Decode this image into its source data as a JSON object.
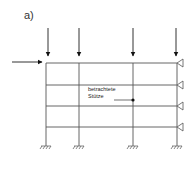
{
  "figure": {
    "label": "a)",
    "annotation": {
      "line1": "betrachtete",
      "line2": "Stütze"
    }
  },
  "structure": {
    "columns_x": [
      46,
      79,
      133,
      177
    ],
    "beams_y": [
      63,
      85,
      106,
      127
    ],
    "ground_y": 146,
    "right_supports": "roller-triangles at each floor",
    "vertical_loads": 4,
    "horizontal_load": 1
  },
  "colors": {
    "line": "#555555",
    "arrow": "#111111"
  }
}
